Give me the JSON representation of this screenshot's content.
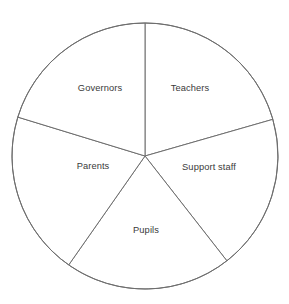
{
  "chart_data": {
    "type": "pie",
    "title": "",
    "subtitle": "",
    "xlabel": "",
    "ylabel": "",
    "legend": "none",
    "grid": false,
    "labels_inside_slices": true,
    "stroke_color": "#6e6e6e",
    "fill_color": "#ffffff",
    "label_color": "#3a3a3a",
    "background": "#ffffff",
    "center": {
      "x": 145,
      "y": 156
    },
    "radius": 133,
    "categories": [
      "Teachers",
      "Support staff",
      "Pupils",
      "Parents",
      "Governors"
    ],
    "values": [
      20,
      19.5,
      20,
      20.5,
      20
    ],
    "units": "percent",
    "slices": [
      {
        "name": "Teachers",
        "label": "Teachers",
        "value": 20,
        "start_angle_deg": 90,
        "end_angle_deg": 16,
        "label_x": 190,
        "label_y": 89
      },
      {
        "name": "Support staff",
        "label": "Support staff",
        "value": 19.5,
        "start_angle_deg": 16,
        "end_angle_deg": -52,
        "label_x": 209,
        "label_y": 168
      },
      {
        "name": "Pupils",
        "label": "Pupils",
        "value": 20,
        "start_angle_deg": -52,
        "end_angle_deg": -125,
        "label_x": 146,
        "label_y": 231
      },
      {
        "name": "Parents",
        "label": "Parents",
        "value": 20.5,
        "start_angle_deg": -125,
        "end_angle_deg": -197,
        "label_x": 93,
        "label_y": 167
      },
      {
        "name": "Governors",
        "label": "Governors",
        "value": 20,
        "start_angle_deg": -197,
        "end_angle_deg": -270,
        "label_x": 100,
        "label_y": 89
      }
    ]
  }
}
